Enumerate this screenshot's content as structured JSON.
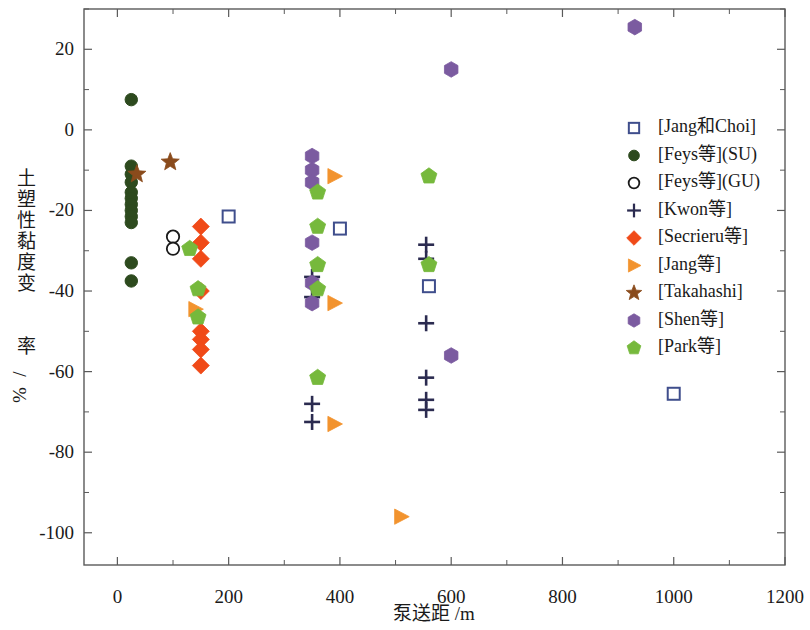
{
  "chart_data": {
    "type": "scatter",
    "title": "",
    "xlabel": "泵送距  /m",
    "ylabel": "土塑性黏度变  率/%",
    "xlim": [
      -60,
      1200
    ],
    "ylim": [
      -108,
      30
    ],
    "xticks": [
      0,
      200,
      400,
      600,
      800,
      1000,
      1200
    ],
    "yticks": [
      20,
      0,
      -20,
      -40,
      -60,
      -80,
      -100
    ],
    "xtick_labels": [
      "0",
      "200",
      "400",
      "600",
      "800",
      "1000",
      "1200"
    ],
    "ytick_labels": [
      "20",
      "0",
      "-20",
      "-40",
      "-60",
      "-80",
      "-100"
    ],
    "grid": false,
    "legend_position": "right",
    "minor_ticks": true,
    "series": [
      {
        "name": "[Jang和Choi]",
        "marker": "open-square",
        "color": "#ffffff",
        "edge_color": "#3f4e8c",
        "points": [
          {
            "x": 200,
            "y": -21.5
          },
          {
            "x": 400,
            "y": -24.5
          },
          {
            "x": 560,
            "y": -38.8
          },
          {
            "x": 1000,
            "y": -65.5
          }
        ]
      },
      {
        "name": "[Feys等](SU)",
        "marker": "filled-circle",
        "color": "#2d4a1e",
        "edge_color": "#2d4a1e",
        "points": [
          {
            "x": 25,
            "y": 7.5
          },
          {
            "x": 25,
            "y": -9.0
          },
          {
            "x": 25,
            "y": -11.0
          },
          {
            "x": 25,
            "y": -13.0
          },
          {
            "x": 25,
            "y": -15.5
          },
          {
            "x": 25,
            "y": -17.0
          },
          {
            "x": 25,
            "y": -18.5
          },
          {
            "x": 25,
            "y": -20.0
          },
          {
            "x": 25,
            "y": -21.5
          },
          {
            "x": 25,
            "y": -23.0
          },
          {
            "x": 25,
            "y": -33.0
          },
          {
            "x": 25,
            "y": -37.5
          }
        ]
      },
      {
        "name": "[Feys等](GU)",
        "marker": "open-circle",
        "color": "#ffffff",
        "edge_color": "#1a1a1a",
        "points": [
          {
            "x": 100,
            "y": -26.5
          },
          {
            "x": 100,
            "y": -29.5
          }
        ]
      },
      {
        "name": "[Kwon等]",
        "marker": "plus",
        "color": "#2b2b50",
        "edge_color": "#2b2b50",
        "points": [
          {
            "x": 350,
            "y": -36.5
          },
          {
            "x": 350,
            "y": -41.5
          },
          {
            "x": 350,
            "y": -68.0
          },
          {
            "x": 350,
            "y": -72.5
          },
          {
            "x": 555,
            "y": -28.5
          },
          {
            "x": 555,
            "y": -32.0
          },
          {
            "x": 555,
            "y": -48.0
          },
          {
            "x": 555,
            "y": -61.5
          },
          {
            "x": 555,
            "y": -67.0
          },
          {
            "x": 555,
            "y": -69.5
          }
        ]
      },
      {
        "name": "[Secrieru等]",
        "marker": "diamond",
        "color": "#f04a18",
        "edge_color": "#f04a18",
        "points": [
          {
            "x": 150,
            "y": -24.0
          },
          {
            "x": 150,
            "y": -28.0
          },
          {
            "x": 150,
            "y": -32.0
          },
          {
            "x": 150,
            "y": -40.0
          },
          {
            "x": 150,
            "y": -50.0
          },
          {
            "x": 150,
            "y": -52.0
          },
          {
            "x": 150,
            "y": -54.5
          },
          {
            "x": 150,
            "y": -58.5
          }
        ]
      },
      {
        "name": "[Jang等]",
        "marker": "right-triangle",
        "color": "#f2932e",
        "edge_color": "#f2932e",
        "points": [
          {
            "x": 140,
            "y": -44.5
          },
          {
            "x": 390,
            "y": -11.5
          },
          {
            "x": 390,
            "y": -43.0
          },
          {
            "x": 390,
            "y": -73.0
          },
          {
            "x": 510,
            "y": -96.0
          }
        ]
      },
      {
        "name": "[Takahashi]",
        "marker": "star",
        "color": "#8a4b1c",
        "edge_color": "#8a4b1c",
        "points": [
          {
            "x": 35,
            "y": -11.0
          },
          {
            "x": 95,
            "y": -8.0
          }
        ]
      },
      {
        "name": "[Shen等]",
        "marker": "hexagon",
        "color": "#7b5ba0",
        "edge_color": "#7b5ba0",
        "points": [
          {
            "x": 350,
            "y": -6.5
          },
          {
            "x": 350,
            "y": -10.0
          },
          {
            "x": 350,
            "y": -13.0
          },
          {
            "x": 350,
            "y": -28.0
          },
          {
            "x": 350,
            "y": -38.0
          },
          {
            "x": 350,
            "y": -43.0
          },
          {
            "x": 600,
            "y": 15.0
          },
          {
            "x": 600,
            "y": -56.0
          },
          {
            "x": 930,
            "y": 25.5
          }
        ]
      },
      {
        "name": "[Park等]",
        "marker": "pentagon",
        "color": "#76b93c",
        "edge_color": "#76b93c",
        "points": [
          {
            "x": 130,
            "y": -29.5
          },
          {
            "x": 145,
            "y": -39.5
          },
          {
            "x": 145,
            "y": -46.5
          },
          {
            "x": 360,
            "y": -15.5
          },
          {
            "x": 360,
            "y": -24.0
          },
          {
            "x": 360,
            "y": -33.5
          },
          {
            "x": 360,
            "y": -39.5
          },
          {
            "x": 360,
            "y": -61.5
          },
          {
            "x": 560,
            "y": -11.5
          },
          {
            "x": 560,
            "y": -33.5
          }
        ]
      }
    ]
  },
  "legend": {
    "entries": [
      {
        "label": "[Jang和Choi]",
        "marker": "open-square"
      },
      {
        "label": "[Feys等](SU)",
        "marker": "filled-circle"
      },
      {
        "label": "[Feys等](GU)",
        "marker": "open-circle"
      },
      {
        "label": "[Kwon等]",
        "marker": "plus"
      },
      {
        "label": "[Secrieru等]",
        "marker": "diamond"
      },
      {
        "label": "[Jang等]",
        "marker": "right-triangle"
      },
      {
        "label": "[Takahashi]",
        "marker": "star"
      },
      {
        "label": "[Shen等]",
        "marker": "hexagon"
      },
      {
        "label": "[Park等]",
        "marker": "pentagon"
      }
    ]
  },
  "colors": {
    "jang_choi": "#3f4e8c",
    "feys_su": "#2d4a1e",
    "feys_gu": "#1a1a1a",
    "kwon": "#2b2b50",
    "secrieru": "#f04a18",
    "jang": "#f2932e",
    "takahashi": "#8a4b1c",
    "shen": "#7b5ba0",
    "park": "#76b93c",
    "axis": "#5a5a5a",
    "text": "#1a1a1a",
    "background": "#ffffff"
  }
}
